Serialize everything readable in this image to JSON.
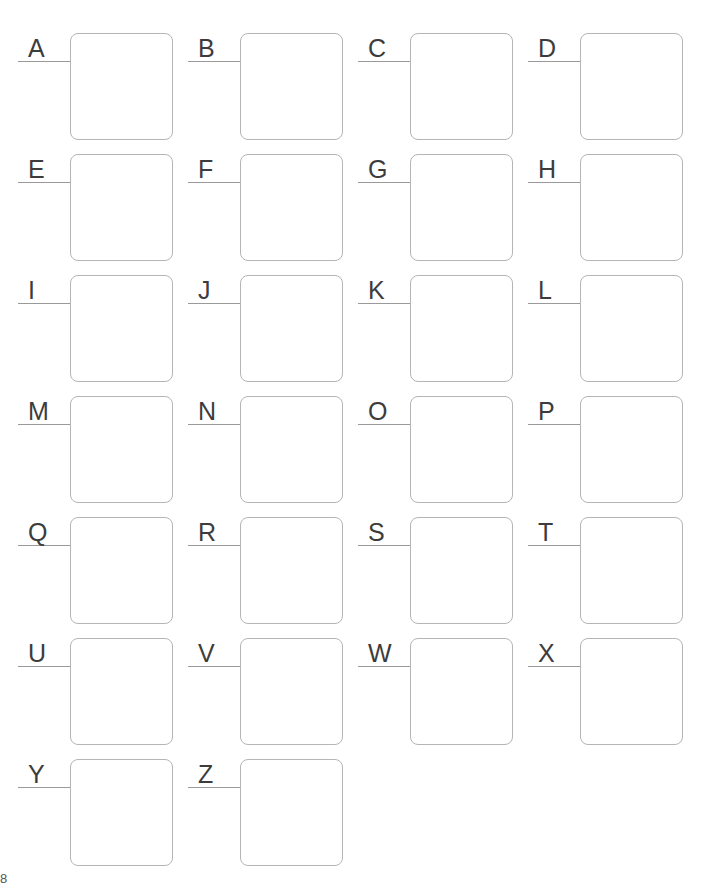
{
  "page": {
    "background_color": "#ffffff",
    "width": 713,
    "height": 889,
    "corner_mark": "8"
  },
  "style": {
    "box_border_color": "#b5b5b5",
    "rule_color": "#9a9a9a",
    "letter_color": "#3c3c3c",
    "box_fill_color": "#ffffff",
    "box_corner_radius": "8px"
  },
  "grid": {
    "columns": 4,
    "rows": 7,
    "column_step": 170,
    "row_step": 121,
    "origin_x": 0,
    "origin_y": 32,
    "cells": [
      {
        "label": "A",
        "col": 0,
        "row": 0,
        "value": "",
        "placeholder": ""
      },
      {
        "label": "B",
        "col": 1,
        "row": 0,
        "value": "",
        "placeholder": ""
      },
      {
        "label": "C",
        "col": 2,
        "row": 0,
        "value": "",
        "placeholder": ""
      },
      {
        "label": "D",
        "col": 3,
        "row": 0,
        "value": "",
        "placeholder": ""
      },
      {
        "label": "E",
        "col": 0,
        "row": 1,
        "value": "",
        "placeholder": ""
      },
      {
        "label": "F",
        "col": 1,
        "row": 1,
        "value": "",
        "placeholder": ""
      },
      {
        "label": "G",
        "col": 2,
        "row": 1,
        "value": "",
        "placeholder": ""
      },
      {
        "label": "H",
        "col": 3,
        "row": 1,
        "value": "",
        "placeholder": ""
      },
      {
        "label": "I",
        "col": 0,
        "row": 2,
        "value": "",
        "placeholder": ""
      },
      {
        "label": "J",
        "col": 1,
        "row": 2,
        "value": "",
        "placeholder": ""
      },
      {
        "label": "K",
        "col": 2,
        "row": 2,
        "value": "",
        "placeholder": ""
      },
      {
        "label": "L",
        "col": 3,
        "row": 2,
        "value": "",
        "placeholder": ""
      },
      {
        "label": "M",
        "col": 0,
        "row": 3,
        "value": "",
        "placeholder": ""
      },
      {
        "label": "N",
        "col": 1,
        "row": 3,
        "value": "",
        "placeholder": ""
      },
      {
        "label": "O",
        "col": 2,
        "row": 3,
        "value": "",
        "placeholder": ""
      },
      {
        "label": "P",
        "col": 3,
        "row": 3,
        "value": "",
        "placeholder": ""
      },
      {
        "label": "Q",
        "col": 0,
        "row": 4,
        "value": "",
        "placeholder": ""
      },
      {
        "label": "R",
        "col": 1,
        "row": 4,
        "value": "",
        "placeholder": ""
      },
      {
        "label": "S",
        "col": 2,
        "row": 4,
        "value": "",
        "placeholder": ""
      },
      {
        "label": "T",
        "col": 3,
        "row": 4,
        "value": "",
        "placeholder": ""
      },
      {
        "label": "U",
        "col": 0,
        "row": 5,
        "value": "",
        "placeholder": ""
      },
      {
        "label": "V",
        "col": 1,
        "row": 5,
        "value": "",
        "placeholder": ""
      },
      {
        "label": "W",
        "col": 2,
        "row": 5,
        "value": "",
        "placeholder": ""
      },
      {
        "label": "X",
        "col": 3,
        "row": 5,
        "value": "",
        "placeholder": ""
      },
      {
        "label": "Y",
        "col": 0,
        "row": 6,
        "value": "",
        "placeholder": ""
      },
      {
        "label": "Z",
        "col": 1,
        "row": 6,
        "value": "",
        "placeholder": ""
      }
    ]
  }
}
